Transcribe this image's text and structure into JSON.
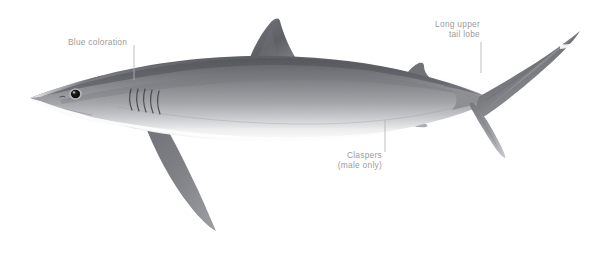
{
  "figure": {
    "background_color": "#ffffff",
    "label_color": "#9c9c9c",
    "leader_color": "#b0b0b0",
    "body_dark": "#5f6166",
    "body_mid": "#8e9094",
    "body_light": "#d9dadc",
    "belly": "#fbfbfb",
    "eye_color": "#141414"
  },
  "annotations": [
    {
      "id": "blue-coloration",
      "text": "Blue coloration",
      "align": "left",
      "leader": {
        "x1": 134,
        "y1": 45,
        "x2": 134,
        "y2": 80
      }
    },
    {
      "id": "long-upper-tail-lobe",
      "line1": "Long upper",
      "line2": "tail lobe",
      "align": "right",
      "leader": {
        "x1": 481,
        "y1": 42,
        "x2": 481,
        "y2": 73
      }
    },
    {
      "id": "claspers",
      "line1": "Claspers",
      "line2": "(male only)",
      "align": "right",
      "leader": {
        "x1": 385,
        "y1": 120,
        "x2": 385,
        "y2": 152
      }
    }
  ],
  "anatomy": {
    "parts": [
      "snout",
      "eye",
      "gill-slits",
      "first-dorsal-fin",
      "second-dorsal-fin",
      "pectoral-fin",
      "pelvic-fin",
      "claspers",
      "anal-fin",
      "caudal-fin-upper-lobe",
      "caudal-fin-lower-lobe",
      "caudal-keel"
    ],
    "gill_slit_count": 5
  }
}
